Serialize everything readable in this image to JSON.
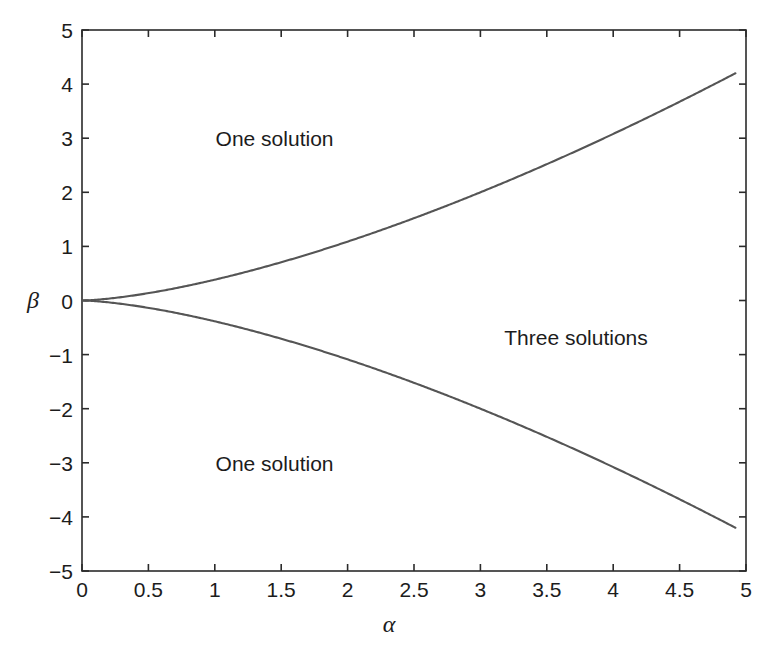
{
  "chart_data": {
    "type": "line",
    "title": "",
    "xlabel": "α",
    "ylabel": "β",
    "xlim": [
      0,
      5
    ],
    "ylim": [
      -5,
      5
    ],
    "grid": false,
    "legend": "none",
    "xticks": [
      "0",
      "0.5",
      "1",
      "1.5",
      "2",
      "2.5",
      "3",
      "3.5",
      "4",
      "4.5",
      "5"
    ],
    "xtick_values": [
      0,
      0.5,
      1,
      1.5,
      2,
      2.5,
      3,
      3.5,
      4,
      4.5,
      5
    ],
    "yticks": [
      "5",
      "4",
      "3",
      "2",
      "1",
      "0",
      "-1",
      "-2",
      "-3",
      "-4",
      "-5"
    ],
    "ytick_values": [
      5,
      4,
      3,
      2,
      1,
      0,
      -1,
      -2,
      -3,
      -4,
      -5
    ],
    "line_color": "#555555",
    "series": [
      {
        "name": "upper fold branch",
        "formula": "beta = +0.385 * alpha^1.5",
        "x": [
          0,
          0.1,
          0.25,
          0.5,
          0.75,
          1,
          1.25,
          1.5,
          1.75,
          2,
          2.25,
          2.5,
          2.75,
          3,
          3.25,
          3.5,
          3.75,
          4,
          4.25,
          4.5,
          4.75,
          4.92
        ],
        "values": [
          0,
          0.012,
          0.048,
          0.136,
          0.25,
          0.385,
          0.538,
          0.707,
          0.891,
          1.089,
          1.299,
          1.522,
          1.756,
          2.0,
          2.255,
          2.521,
          2.796,
          3.08,
          3.374,
          3.676,
          3.988,
          4.2
        ]
      },
      {
        "name": "lower fold branch",
        "formula": "beta = -0.385 * alpha^1.5",
        "x": [
          0,
          0.1,
          0.25,
          0.5,
          0.75,
          1,
          1.25,
          1.5,
          1.75,
          2,
          2.25,
          2.5,
          2.75,
          3,
          3.25,
          3.5,
          3.75,
          4,
          4.25,
          4.5,
          4.75,
          4.92
        ],
        "values": [
          0,
          -0.012,
          -0.048,
          -0.136,
          -0.25,
          -0.385,
          -0.538,
          -0.707,
          -0.891,
          -1.089,
          -1.299,
          -1.522,
          -1.756,
          -2.0,
          -2.255,
          -2.521,
          -2.796,
          -3.08,
          -3.374,
          -3.676,
          -3.988,
          -4.2
        ]
      }
    ],
    "annotations": [
      {
        "text": "One solution",
        "x": 1.45,
        "y": 3.0
      },
      {
        "text": "One solution",
        "x": 1.45,
        "y": -3.0
      },
      {
        "text": "Three solutions",
        "x": 3.72,
        "y": -0.67
      }
    ]
  },
  "figure": {
    "background": "#ffffff",
    "axis_color": "#2b2b2b"
  }
}
